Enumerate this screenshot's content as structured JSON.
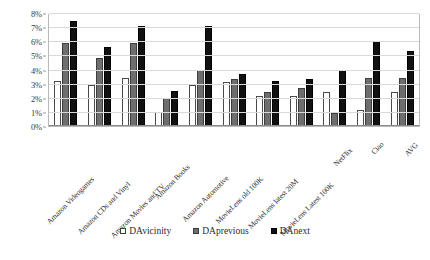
{
  "chart_data": {
    "type": "bar",
    "title": "",
    "subtitle": "",
    "xlabel": "",
    "ylabel": "",
    "ylim": [
      0,
      8
    ],
    "ytick_labels": [
      "0%",
      "1%",
      "2%",
      "3%",
      "4%",
      "5%",
      "6%",
      "7%",
      "8%"
    ],
    "ytick_values": [
      0,
      1,
      2,
      3,
      4,
      5,
      6,
      7,
      8
    ],
    "grid": true,
    "legend_position": "bottom",
    "categories": [
      "Amazon Videogames",
      "Amazon CDs and Vinyl",
      "Amazon Movies and TV",
      "Amazon Books",
      "Amazon Automotive",
      "MovieLens old 100K",
      "MovieLens latest 20M",
      "MovieLens Latest 100K",
      "NetFlix",
      "Ciao",
      "AVG"
    ],
    "series": [
      {
        "name": "DAvicinity",
        "color": "#ffffff",
        "values": [
          3.2,
          2.9,
          3.4,
          1.0,
          2.9,
          3.1,
          2.1,
          2.1,
          2.4,
          1.1,
          2.4
        ]
      },
      {
        "name": "DAprevious",
        "color": "#6e6e6e",
        "values": [
          5.9,
          4.8,
          5.9,
          2.0,
          4.0,
          3.3,
          2.4,
          2.7,
          0.9,
          3.4,
          3.4
        ]
      },
      {
        "name": "DAnext",
        "color": "#111111",
        "values": [
          7.4,
          5.6,
          7.1,
          2.5,
          7.1,
          3.7,
          3.2,
          3.3,
          4.0,
          6.0,
          5.3
        ]
      }
    ]
  },
  "legend": {
    "items": [
      {
        "label": "DAvicinity"
      },
      {
        "label": "DAprevious"
      },
      {
        "label": "DAnext"
      }
    ]
  }
}
